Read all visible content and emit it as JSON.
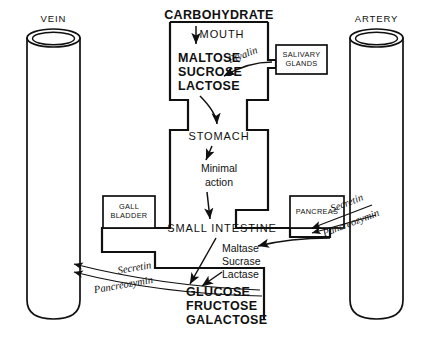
{
  "diagram": {
    "vessels": {
      "vein_label": "VEIN",
      "artery_label": "ARTERY"
    },
    "pathway": {
      "carbohydrate": "CARBOHYDRATE",
      "mouth": "MOUTH",
      "disaccharides": [
        "MALTOSE",
        "SUCROSE",
        "LACTOSE"
      ],
      "stomach": "STOMACH",
      "stomach_action": [
        "Minimal",
        "action"
      ],
      "small_intestine": "SMALL  INTESTINE",
      "intestinal_enzymes": [
        "Maltase",
        "Sucrase",
        "Lactase"
      ],
      "monosaccharides": [
        "GLUCOSE",
        "FRUCTOSE",
        "GALACTOSE"
      ]
    },
    "organs": {
      "salivary_glands": [
        "SALIVARY",
        "GLANDS"
      ],
      "gall_bladder": [
        "GALL",
        "BLADDER"
      ],
      "pancreas": "PANCREAS"
    },
    "enzymes": {
      "ptyalin": "Ptyalin"
    },
    "hormones": {
      "secretin": "Secretin",
      "pancreozymin": "Pancreozymin",
      "secretin_vein": "Secretin",
      "pancreozymin_vein": "Pancreozymin"
    },
    "colors": {
      "ink": "#101010",
      "background": "#ffffff"
    }
  }
}
